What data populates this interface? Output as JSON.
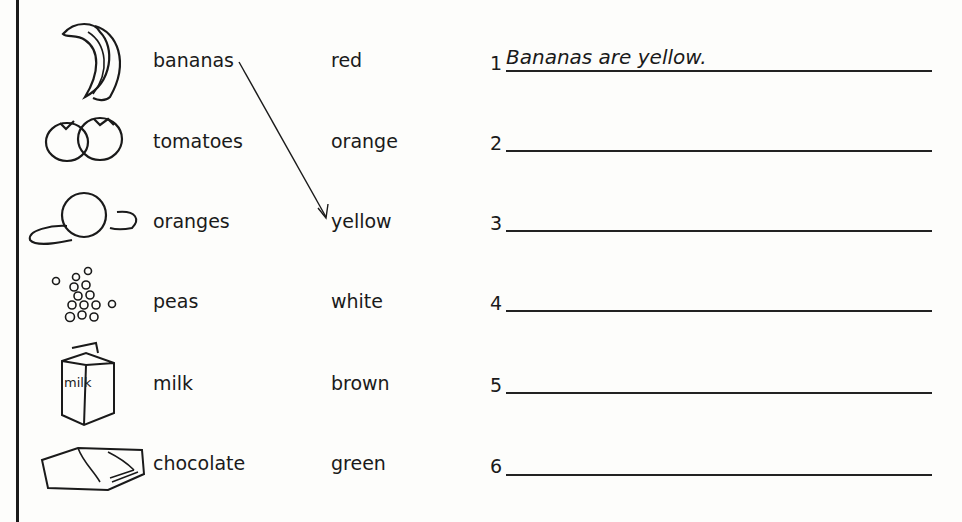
{
  "worksheet": {
    "foods": [
      {
        "label": "bananas",
        "icon": "banana-icon"
      },
      {
        "label": "tomatoes",
        "icon": "tomato-icon"
      },
      {
        "label": "oranges",
        "icon": "orange-icon"
      },
      {
        "label": "peas",
        "icon": "peas-icon"
      },
      {
        "label": "milk",
        "icon": "milk-carton-icon"
      },
      {
        "label": "chocolate",
        "icon": "chocolate-bar-icon"
      }
    ],
    "colors": [
      "red",
      "orange",
      "yellow",
      "white",
      "brown",
      "green"
    ],
    "answers": [
      {
        "number": "1",
        "text": "Bananas are yellow."
      },
      {
        "number": "2",
        "text": ""
      },
      {
        "number": "3",
        "text": ""
      },
      {
        "number": "4",
        "text": ""
      },
      {
        "number": "5",
        "text": ""
      },
      {
        "number": "6",
        "text": ""
      }
    ],
    "example_match": {
      "from": "bananas",
      "to": "yellow"
    }
  }
}
